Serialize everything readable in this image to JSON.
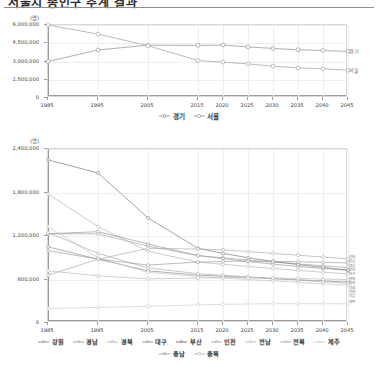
{
  "document": {
    "title": "서울시 총인구 추계 결과",
    "rule_color": "#8d8d8d"
  },
  "chart_data": [
    {
      "id": "chart-top",
      "type": "line",
      "title": "",
      "unit_label": "(명)",
      "xlabel": "",
      "ylabel": "",
      "x": [
        1985,
        1995,
        2005,
        2015,
        2020,
        2025,
        2030,
        2035,
        2040,
        2045
      ],
      "xticklabels": [
        "1985",
        "1995",
        "2005",
        "2015",
        "2020",
        "2025",
        "2030",
        "2035",
        "2040",
        "2045"
      ],
      "yticks": [
        0,
        1500000,
        3000000,
        4500000,
        6000000
      ],
      "yticklabels": [
        "0",
        "1,500,000",
        "3,000,000",
        "4,500,000",
        "6,000,000"
      ],
      "ylim": [
        0,
        6000000
      ],
      "grid": true,
      "legend_position": "bottom",
      "series": [
        {
          "name": "경기",
          "color": "#9b9b9b",
          "end_label": "경기",
          "values": [
            3000000,
            3950000,
            4340000,
            4320000,
            4350000,
            4200000,
            4070000,
            3970000,
            3900000,
            3830000
          ]
        },
        {
          "name": "서울",
          "color": "#a8a8a8",
          "end_label": "서울",
          "values": [
            6000000,
            5250000,
            4300000,
            3080000,
            2950000,
            2800000,
            2620000,
            2480000,
            2400000,
            2280000
          ]
        }
      ]
    },
    {
      "id": "chart-bottom",
      "type": "line",
      "title": "",
      "unit_label": "(명)",
      "xlabel": "",
      "ylabel": "",
      "x": [
        1985,
        1995,
        2005,
        2015,
        2020,
        2025,
        2030,
        2035,
        2040,
        2045
      ],
      "xticklabels": [
        "1985",
        "1995",
        "2005",
        "2015",
        "2020",
        "2025",
        "2030",
        "2035",
        "2040",
        "2045"
      ],
      "yticks": [
        0,
        600000,
        1200000,
        1800000,
        2400000
      ],
      "yticklabels": [
        "0",
        "600,000",
        "1,200,000",
        "1,800,000",
        "2,400,000"
      ],
      "ylim": [
        0,
        2400000
      ],
      "grid": true,
      "legend_position": "bottom",
      "series": [
        {
          "name": "강원",
          "color": "#8f8f8f",
          "end_label": "강원",
          "values": [
            1050000,
            880000,
            720000,
            660000,
            645000,
            630000,
            612000,
            596000,
            580000,
            565000
          ]
        },
        {
          "name": "경남",
          "color": "#a6a6a6",
          "end_label": "경남",
          "values": [
            1230000,
            1230000,
            1060000,
            930000,
            900000,
            870000,
            840000,
            815000,
            790000,
            765000
          ]
        },
        {
          "name": "경북",
          "color": "#b5b5b5",
          "end_label": "경북",
          "values": [
            1780000,
            1330000,
            990000,
            840000,
            810000,
            780000,
            752000,
            726000,
            700000,
            678000
          ]
        },
        {
          "name": "대구",
          "color": "#9a9a9a",
          "end_label": "대구",
          "values": [
            1230000,
            1260000,
            1090000,
            930000,
            888000,
            848000,
            812000,
            780000,
            752000,
            726000
          ]
        },
        {
          "name": "부산",
          "color": "#7d7d7d",
          "end_label": "부산",
          "values": [
            2250000,
            2070000,
            1450000,
            1030000,
            960000,
            900000,
            850000,
            806000,
            768000,
            730000
          ]
        },
        {
          "name": "인천",
          "color": "#adadad",
          "end_label": "인천",
          "values": [
            660000,
            880000,
            1030000,
            1020000,
            1010000,
            985000,
            960000,
            935000,
            910000,
            885000
          ]
        },
        {
          "name": "전남",
          "color": "#c4c4c4",
          "end_label": "전남",
          "values": [
            1330000,
            900000,
            700000,
            640000,
            620000,
            600000,
            580000,
            560000,
            540000,
            522000
          ]
        },
        {
          "name": "전북",
          "color": "#b0b0b0",
          "end_label": "전북",
          "values": [
            1250000,
            960000,
            760000,
            680000,
            658000,
            636000,
            614000,
            592000,
            570000,
            550000
          ]
        },
        {
          "name": "제주",
          "color": "#cfcfcf",
          "end_label": "제주",
          "values": [
            200000,
            215000,
            230000,
            250000,
            258000,
            262000,
            265000,
            266000,
            266000,
            264000
          ]
        },
        {
          "name": "충남",
          "color": "#9f9f9f",
          "end_label": "충남",
          "values": [
            1000000,
            880000,
            800000,
            840000,
            850000,
            852000,
            850000,
            845000,
            838000,
            828000
          ]
        },
        {
          "name": "충북",
          "color": "#bbbbbb",
          "end_label": "충북",
          "values": [
            720000,
            650000,
            610000,
            620000,
            625000,
            624000,
            620000,
            614000,
            606000,
            598000
          ]
        }
      ]
    }
  ]
}
